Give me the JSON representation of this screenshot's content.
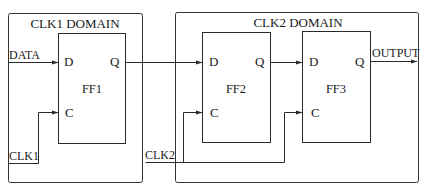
{
  "diagram": {
    "type": "clock-domain-crossing-schematic",
    "colors": {
      "line": "#2a2a2a",
      "background": "#ffffff",
      "text": "#1a1a1a"
    },
    "domains": [
      {
        "id": "clk1-domain",
        "title": "CLK1 DOMAIN"
      },
      {
        "id": "clk2-domain",
        "title": "CLK2 DOMAIN"
      }
    ],
    "flipflops": [
      {
        "id": "ff1",
        "name": "FF1",
        "d_pin": "D",
        "q_pin": "Q",
        "c_pin": "C",
        "domain": "CLK1 DOMAIN"
      },
      {
        "id": "ff2",
        "name": "FF2",
        "d_pin": "D",
        "q_pin": "Q",
        "c_pin": "C",
        "domain": "CLK2 DOMAIN"
      },
      {
        "id": "ff3",
        "name": "FF3",
        "d_pin": "D",
        "q_pin": "Q",
        "c_pin": "C",
        "domain": "CLK2 DOMAIN"
      }
    ],
    "signals": {
      "data": "DATA",
      "output": "OUTPUT",
      "clk1": "CLK1",
      "clk2": "CLK2"
    },
    "connections": [
      {
        "from": "DATA",
        "to": "FF1.D"
      },
      {
        "from": "FF1.Q",
        "to": "FF2.D"
      },
      {
        "from": "FF2.Q",
        "to": "FF3.D"
      },
      {
        "from": "FF3.Q",
        "to": "OUTPUT"
      },
      {
        "from": "CLK1",
        "to": "FF1.C"
      },
      {
        "from": "CLK2",
        "to": "FF2.C"
      },
      {
        "from": "CLK2",
        "to": "FF3.C"
      }
    ]
  }
}
